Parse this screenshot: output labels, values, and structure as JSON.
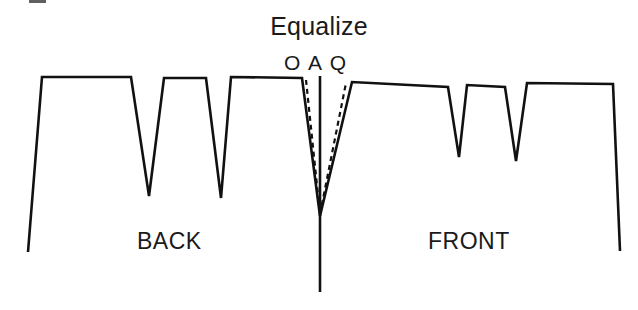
{
  "figure": {
    "title": "Equalize",
    "background_color": "#ffffff",
    "ink_color": "#111111",
    "labels": {
      "back": "BACK",
      "front": "FRONT"
    },
    "markers": [
      "O",
      "A",
      "Q"
    ],
    "marker_names": [
      "marker-o",
      "marker-a",
      "marker-q"
    ]
  },
  "chart_data": {
    "type": "line",
    "title": "Equalize",
    "subtitle": "",
    "xlabel": "",
    "ylabel": "",
    "grid": false,
    "legend": "none",
    "annotations": [
      {
        "text": "Equalize",
        "x": 320,
        "y": 28,
        "name": "title-annotation"
      },
      {
        "text": "O",
        "x": 290,
        "y": 66,
        "name": "marker-o"
      },
      {
        "text": "A",
        "x": 318,
        "y": 66,
        "name": "marker-a"
      },
      {
        "text": "Q",
        "x": 340,
        "y": 66,
        "name": "marker-q"
      },
      {
        "text": "BACK",
        "x": 175,
        "y": 245,
        "name": "back-label"
      },
      {
        "text": "FRONT",
        "x": 470,
        "y": 245,
        "name": "front-label"
      }
    ],
    "axis_note": "pixel coordinates; y increases downward",
    "xlim": [
      0,
      638
    ],
    "ylim": [
      310,
      0
    ],
    "series": [
      {
        "name": "profile-solid",
        "style": "solid",
        "color": "#111111",
        "width": 2.6,
        "points": [
          [
            28,
            252
          ],
          [
            42,
            77
          ],
          [
            131,
            77
          ],
          [
            149,
            196
          ],
          [
            164,
            78
          ],
          [
            206,
            78
          ],
          [
            221,
            198
          ],
          [
            231,
            77
          ],
          [
            302,
            78
          ],
          [
            320,
            216
          ],
          [
            352,
            82
          ],
          [
            448,
            87
          ],
          [
            459,
            157
          ],
          [
            467,
            85
          ],
          [
            505,
            87
          ],
          [
            516,
            161
          ],
          [
            527,
            83
          ],
          [
            613,
            84
          ],
          [
            620,
            251
          ]
        ]
      },
      {
        "name": "dashed-left-branch",
        "style": "dashed",
        "color": "#111111",
        "width": 2.2,
        "points": [
          [
            306,
            80
          ],
          [
            320,
            214
          ]
        ]
      },
      {
        "name": "dashed-right-branch",
        "style": "dashed",
        "color": "#111111",
        "width": 2.2,
        "points": [
          [
            320,
            214
          ],
          [
            346,
            83
          ]
        ]
      },
      {
        "name": "center-axis-line",
        "style": "solid",
        "color": "#111111",
        "width": 2.6,
        "points": [
          [
            320,
            76
          ],
          [
            320,
            292
          ]
        ]
      }
    ]
  }
}
